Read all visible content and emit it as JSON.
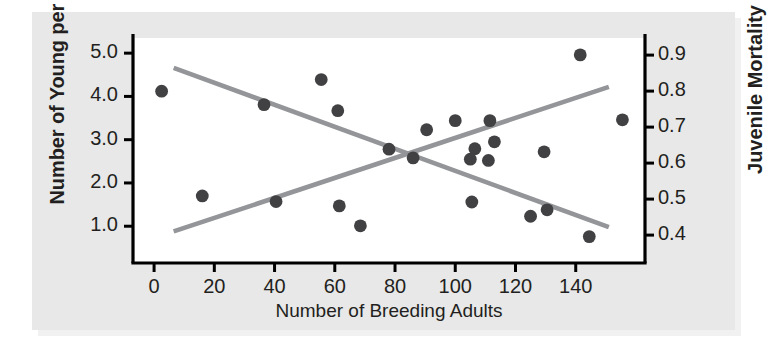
{
  "chart_data": {
    "type": "scatter",
    "title": "",
    "xlabel": "Number of Breeding Adults",
    "ylabel": "Number of Young per Female",
    "y2label": "Juvenile Mortality",
    "xlim": [
      -7,
      163
    ],
    "ylim": [
      0.15,
      5.35
    ],
    "y2lim": [
      0.3225,
      0.9475
    ],
    "xticks": [
      0,
      20,
      40,
      60,
      80,
      100,
      120,
      140
    ],
    "xtick_labels": [
      "0",
      "20",
      "40",
      "60",
      "80",
      "100",
      "120",
      "140"
    ],
    "yticks": [
      1.0,
      2.0,
      3.0,
      4.0,
      5.0
    ],
    "ytick_labels": [
      "1.0",
      "2.0",
      "3.0",
      "4.0",
      "5.0"
    ],
    "y2ticks": [
      0.4,
      0.5,
      0.6,
      0.7,
      0.8,
      0.9
    ],
    "y2tick_labels": [
      "0.4",
      "0.5",
      "0.6",
      "0.7",
      "0.8",
      "0.9"
    ],
    "grid": false,
    "legend": false,
    "marker_color": "#414042",
    "line_color": "#939598",
    "axis_color": "#000000",
    "plot_bg": "#ffffff",
    "panel_bg": "#e8e8e8",
    "series": [
      {
        "name": "Number of Young per Female",
        "axis": "left",
        "points": [
          {
            "x": 2.5,
            "y": 4.12
          },
          {
            "x": 16.0,
            "y": 1.7
          },
          {
            "x": 36.5,
            "y": 3.81
          },
          {
            "x": 40.5,
            "y": 1.57
          },
          {
            "x": 55.5,
            "y": 4.39
          },
          {
            "x": 61.0,
            "y": 3.67
          },
          {
            "x": 61.5,
            "y": 1.47
          },
          {
            "x": 68.5,
            "y": 1.01
          },
          {
            "x": 78.0,
            "y": 2.78
          },
          {
            "x": 86.0,
            "y": 2.58
          },
          {
            "x": 90.5,
            "y": 3.23
          },
          {
            "x": 100.0,
            "y": 3.44
          },
          {
            "x": 105.0,
            "y": 2.55
          },
          {
            "x": 106.5,
            "y": 2.79
          },
          {
            "x": 105.5,
            "y": 1.56
          },
          {
            "x": 111.5,
            "y": 3.44
          },
          {
            "x": 111.0,
            "y": 2.52
          },
          {
            "x": 113.0,
            "y": 2.95
          },
          {
            "x": 125.0,
            "y": 1.23
          },
          {
            "x": 129.5,
            "y": 2.72
          },
          {
            "x": 130.5,
            "y": 1.38
          },
          {
            "x": 141.5,
            "y": 4.96
          },
          {
            "x": 144.5,
            "y": 0.76
          },
          {
            "x": 155.5,
            "y": 3.46
          }
        ]
      }
    ],
    "trend_lines": [
      {
        "name": "declining-trend-line",
        "color": "#939598",
        "x0": 6.5,
        "y0": 4.66,
        "x1": 151.0,
        "y1": 0.98
      },
      {
        "name": "rising-trend-line",
        "color": "#939598",
        "x0": 6.5,
        "y0": 0.88,
        "x1": 151.0,
        "y1": 4.22
      }
    ]
  },
  "axes": {
    "left_title": "Number of Young per Female",
    "right_title": "Juvenile Mortality",
    "bottom_title": "Number of Breeding Adults"
  }
}
